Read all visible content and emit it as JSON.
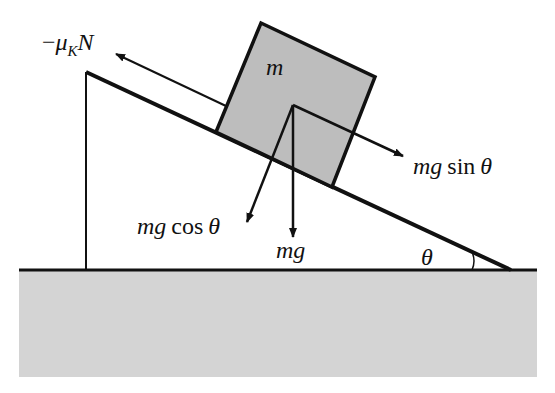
{
  "diagram": {
    "colors": {
      "line": "#111111",
      "block_fill": "#bdbdbd",
      "ground_fill": "#d4d4d4",
      "background": "#ffffff"
    },
    "labels": {
      "mass": "m",
      "friction_minus": "−",
      "friction_mu": "μ",
      "friction_sub": "K",
      "friction_n": "N",
      "parallel_mg": "mg",
      "parallel_fn": "sin",
      "parallel_theta": "θ",
      "normal_mg": "mg",
      "normal_fn": "cos",
      "normal_theta": "θ",
      "weight": "mg",
      "angle": "θ"
    },
    "forces": [
      {
        "name": "friction",
        "label": "−μ_K N",
        "direction": "up the incline"
      },
      {
        "name": "gravity-parallel",
        "label": "mg sin θ",
        "direction": "down the incline"
      },
      {
        "name": "gravity-perpendicular",
        "label": "mg cos θ",
        "direction": "into the incline"
      },
      {
        "name": "weight",
        "label": "mg",
        "direction": "vertically down"
      }
    ]
  }
}
